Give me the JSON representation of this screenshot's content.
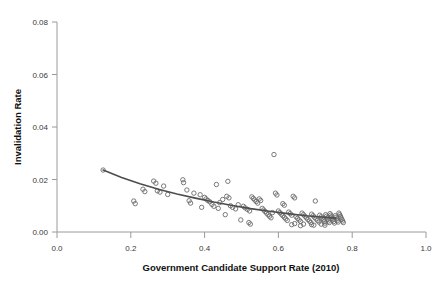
{
  "chart_data": {
    "type": "scatter",
    "title": "",
    "xlabel": "Government Candidate Support Rate (2010)",
    "ylabel": "Invalidation Rate",
    "xlim": [
      0.0,
      1.0
    ],
    "ylim": [
      0.0,
      0.08
    ],
    "xticks": [
      "0.0",
      "0.2",
      "0.4",
      "0.6",
      "0.8",
      "1.0"
    ],
    "xtick_values": [
      0.0,
      0.2,
      0.4,
      0.6,
      0.8,
      1.0
    ],
    "yticks": [
      "0.00",
      "0.02",
      "0.04",
      "0.06",
      "0.08"
    ],
    "ytick_values": [
      0.0,
      0.02,
      0.04,
      0.06,
      0.08
    ],
    "grid": false,
    "legend": "none",
    "marker": "open-circle",
    "marker_color": "#6b6b6b",
    "fit_line_color": "#4d4d4d",
    "axis_color": "#9a9a9a",
    "points": [
      [
        0.125,
        0.0236
      ],
      [
        0.208,
        0.0118
      ],
      [
        0.212,
        0.0108
      ],
      [
        0.233,
        0.0163
      ],
      [
        0.238,
        0.0154
      ],
      [
        0.262,
        0.0194
      ],
      [
        0.268,
        0.0186
      ],
      [
        0.272,
        0.0157
      ],
      [
        0.279,
        0.0152
      ],
      [
        0.289,
        0.0175
      ],
      [
        0.341,
        0.0199
      ],
      [
        0.343,
        0.0188
      ],
      [
        0.358,
        0.0119
      ],
      [
        0.362,
        0.011
      ],
      [
        0.371,
        0.0148
      ],
      [
        0.388,
        0.0142
      ],
      [
        0.392,
        0.0094
      ],
      [
        0.4,
        0.0132
      ],
      [
        0.404,
        0.0126
      ],
      [
        0.409,
        0.012
      ],
      [
        0.414,
        0.0115
      ],
      [
        0.42,
        0.0105
      ],
      [
        0.425,
        0.0098
      ],
      [
        0.432,
        0.0181
      ],
      [
        0.437,
        0.009
      ],
      [
        0.441,
        0.0112
      ],
      [
        0.449,
        0.0124
      ],
      [
        0.456,
        0.0066
      ],
      [
        0.463,
        0.0193
      ],
      [
        0.47,
        0.01
      ],
      [
        0.476,
        0.0094
      ],
      [
        0.484,
        0.0088
      ],
      [
        0.491,
        0.0104
      ],
      [
        0.498,
        0.0046
      ],
      [
        0.505,
        0.0098
      ],
      [
        0.51,
        0.0092
      ],
      [
        0.516,
        0.0086
      ],
      [
        0.522,
        0.008
      ],
      [
        0.528,
        0.0134
      ],
      [
        0.532,
        0.0128
      ],
      [
        0.536,
        0.0122
      ],
      [
        0.54,
        0.0116
      ],
      [
        0.544,
        0.011
      ],
      [
        0.548,
        0.0126
      ],
      [
        0.552,
        0.012
      ],
      [
        0.556,
        0.009
      ],
      [
        0.56,
        0.0084
      ],
      [
        0.564,
        0.0078
      ],
      [
        0.568,
        0.0072
      ],
      [
        0.572,
        0.0066
      ],
      [
        0.576,
        0.006
      ],
      [
        0.58,
        0.0054
      ],
      [
        0.584,
        0.0074
      ],
      [
        0.588,
        0.0295
      ],
      [
        0.592,
        0.0148
      ],
      [
        0.596,
        0.0141
      ],
      [
        0.6,
        0.008
      ],
      [
        0.604,
        0.0074
      ],
      [
        0.608,
        0.0068
      ],
      [
        0.612,
        0.0062
      ],
      [
        0.616,
        0.0056
      ],
      [
        0.62,
        0.005
      ],
      [
        0.624,
        0.0044
      ],
      [
        0.628,
        0.0076
      ],
      [
        0.632,
        0.007
      ],
      [
        0.636,
        0.0064
      ],
      [
        0.64,
        0.0136
      ],
      [
        0.644,
        0.013
      ],
      [
        0.648,
        0.0058
      ],
      [
        0.652,
        0.0052
      ],
      [
        0.656,
        0.0046
      ],
      [
        0.66,
        0.004
      ],
      [
        0.664,
        0.0072
      ],
      [
        0.668,
        0.0066
      ],
      [
        0.672,
        0.006
      ],
      [
        0.676,
        0.0054
      ],
      [
        0.68,
        0.0048
      ],
      [
        0.684,
        0.0042
      ],
      [
        0.688,
        0.0036
      ],
      [
        0.69,
        0.0068
      ],
      [
        0.694,
        0.0062
      ],
      [
        0.698,
        0.0056
      ],
      [
        0.7,
        0.0118
      ],
      [
        0.702,
        0.005
      ],
      [
        0.706,
        0.0044
      ],
      [
        0.71,
        0.0038
      ],
      [
        0.712,
        0.0064
      ],
      [
        0.716,
        0.0058
      ],
      [
        0.718,
        0.0052
      ],
      [
        0.722,
        0.0046
      ],
      [
        0.724,
        0.004
      ],
      [
        0.726,
        0.0034
      ],
      [
        0.728,
        0.0066
      ],
      [
        0.73,
        0.006
      ],
      [
        0.732,
        0.0054
      ],
      [
        0.734,
        0.0048
      ],
      [
        0.736,
        0.0042
      ],
      [
        0.738,
        0.0036
      ],
      [
        0.74,
        0.007
      ],
      [
        0.742,
        0.0064
      ],
      [
        0.744,
        0.0058
      ],
      [
        0.746,
        0.0052
      ],
      [
        0.748,
        0.0046
      ],
      [
        0.75,
        0.004
      ],
      [
        0.752,
        0.0034
      ],
      [
        0.754,
        0.0062
      ],
      [
        0.756,
        0.0056
      ],
      [
        0.758,
        0.005
      ],
      [
        0.76,
        0.0044
      ],
      [
        0.762,
        0.0038
      ],
      [
        0.764,
        0.0072
      ],
      [
        0.766,
        0.0066
      ],
      [
        0.768,
        0.006
      ],
      [
        0.77,
        0.0054
      ],
      [
        0.772,
        0.0048
      ],
      [
        0.774,
        0.0042
      ],
      [
        0.776,
        0.0036
      ],
      [
        0.612,
        0.0108
      ],
      [
        0.616,
        0.0102
      ],
      [
        0.52,
        0.0036
      ],
      [
        0.524,
        0.003
      ],
      [
        0.46,
        0.0136
      ],
      [
        0.466,
        0.013
      ],
      [
        0.3,
        0.0143
      ],
      [
        0.352,
        0.016
      ],
      [
        0.69,
        0.0028
      ],
      [
        0.696,
        0.0026
      ],
      [
        0.66,
        0.0024
      ],
      [
        0.668,
        0.003
      ],
      [
        0.636,
        0.0028
      ],
      [
        0.644,
        0.0032
      ],
      [
        0.716,
        0.003
      ],
      [
        0.726,
        0.0026
      ]
    ],
    "fit_line": [
      [
        0.125,
        0.0236
      ],
      [
        0.175,
        0.0208
      ],
      [
        0.225,
        0.0184
      ],
      [
        0.275,
        0.0163
      ],
      [
        0.325,
        0.0145
      ],
      [
        0.375,
        0.0129
      ],
      [
        0.425,
        0.0114
      ],
      [
        0.475,
        0.0101
      ],
      [
        0.525,
        0.0089
      ],
      [
        0.575,
        0.0079
      ],
      [
        0.625,
        0.007
      ],
      [
        0.675,
        0.0062
      ],
      [
        0.715,
        0.0057
      ],
      [
        0.755,
        0.0053
      ]
    ]
  }
}
